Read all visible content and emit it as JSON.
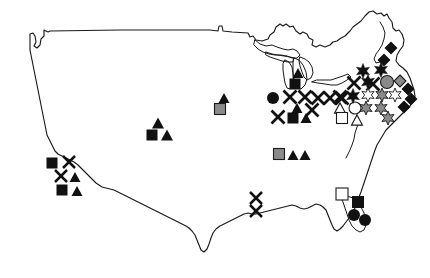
{
  "map": {
    "title": "United States distribution map",
    "region": "Contiguous United States",
    "background_color": "#ffffff",
    "outline_color": "#1a1a1a",
    "outline_width": 1.15,
    "width": 430,
    "height": 278
  },
  "palette": {
    "black": "#111111",
    "gray": "#8a8a8a",
    "white": "#ffffff",
    "stroke": "#1a1a1a"
  },
  "legend": {
    "shown": false,
    "shapes": [
      "star",
      "diamond",
      "circle",
      "square",
      "triangle",
      "x"
    ],
    "fills": [
      "black",
      "gray",
      "white"
    ]
  },
  "chart_data": {
    "type": "scatter",
    "xlabel": "",
    "ylabel": "",
    "xlim": [
      0,
      430
    ],
    "ylim": [
      0,
      278
    ],
    "grid": false,
    "legend_position": "none",
    "marker_counts": {
      "x": 24,
      "triangle": 16,
      "square": 11,
      "star": 13,
      "diamond": 9,
      "circle": 6,
      "total": 79
    },
    "fill_counts": {
      "black": 59,
      "gray": 14,
      "white": 6
    },
    "markers": [
      {
        "shape": "square",
        "fill": "black",
        "x": 52,
        "y": 163,
        "size": 11
      },
      {
        "shape": "x",
        "fill": "black",
        "x": 69,
        "y": 162,
        "size": 12
      },
      {
        "shape": "x",
        "fill": "black",
        "x": 61,
        "y": 176,
        "size": 12
      },
      {
        "shape": "triangle",
        "fill": "black",
        "x": 75,
        "y": 177,
        "size": 11
      },
      {
        "shape": "square",
        "fill": "black",
        "x": 62,
        "y": 190,
        "size": 11
      },
      {
        "shape": "triangle",
        "fill": "black",
        "x": 77,
        "y": 191,
        "size": 11
      },
      {
        "shape": "triangle",
        "fill": "black",
        "x": 158,
        "y": 123,
        "size": 12
      },
      {
        "shape": "square",
        "fill": "black",
        "x": 152,
        "y": 135,
        "size": 11
      },
      {
        "shape": "triangle",
        "fill": "black",
        "x": 167,
        "y": 135,
        "size": 12
      },
      {
        "shape": "triangle",
        "fill": "black",
        "x": 224,
        "y": 98,
        "size": 11
      },
      {
        "shape": "square",
        "fill": "gray",
        "x": 220,
        "y": 109,
        "size": 11
      },
      {
        "shape": "x",
        "fill": "black",
        "x": 256,
        "y": 198,
        "size": 12
      },
      {
        "shape": "x",
        "fill": "black",
        "x": 256,
        "y": 211,
        "size": 12
      },
      {
        "shape": "square",
        "fill": "gray",
        "x": 279,
        "y": 154,
        "size": 11
      },
      {
        "shape": "triangle",
        "fill": "black",
        "x": 293,
        "y": 155,
        "size": 11
      },
      {
        "shape": "triangle",
        "fill": "black",
        "x": 305,
        "y": 155,
        "size": 11
      },
      {
        "shape": "circle",
        "fill": "black",
        "x": 273,
        "y": 98,
        "size": 12
      },
      {
        "shape": "triangle",
        "fill": "black",
        "x": 298,
        "y": 73,
        "size": 11
      },
      {
        "shape": "square",
        "fill": "black",
        "x": 295,
        "y": 84,
        "size": 11
      },
      {
        "shape": "x",
        "fill": "black",
        "x": 290,
        "y": 97,
        "size": 13
      },
      {
        "shape": "x",
        "fill": "black",
        "x": 305,
        "y": 97,
        "size": 13
      },
      {
        "shape": "x",
        "fill": "black",
        "x": 318,
        "y": 98,
        "size": 13
      },
      {
        "shape": "x",
        "fill": "black",
        "x": 330,
        "y": 98,
        "size": 13
      },
      {
        "shape": "x",
        "fill": "black",
        "x": 342,
        "y": 98,
        "size": 13
      },
      {
        "shape": "triangle",
        "fill": "black",
        "x": 297,
        "y": 108,
        "size": 11
      },
      {
        "shape": "x",
        "fill": "black",
        "x": 312,
        "y": 110,
        "size": 13
      },
      {
        "shape": "x",
        "fill": "black",
        "x": 278,
        "y": 117,
        "size": 13
      },
      {
        "shape": "square",
        "fill": "black",
        "x": 293,
        "y": 118,
        "size": 11
      },
      {
        "shape": "triangle",
        "fill": "black",
        "x": 306,
        "y": 118,
        "size": 11
      },
      {
        "shape": "triangle",
        "fill": "white",
        "x": 340,
        "y": 108,
        "size": 11
      },
      {
        "shape": "circle",
        "fill": "white",
        "x": 355,
        "y": 108,
        "size": 12
      },
      {
        "shape": "square",
        "fill": "white",
        "x": 342,
        "y": 118,
        "size": 11
      },
      {
        "shape": "triangle",
        "fill": "white",
        "x": 357,
        "y": 120,
        "size": 11
      },
      {
        "shape": "star",
        "fill": "black",
        "x": 363,
        "y": 71,
        "size": 15
      },
      {
        "shape": "star",
        "fill": "black",
        "x": 381,
        "y": 70,
        "size": 15
      },
      {
        "shape": "diamond",
        "fill": "black",
        "x": 384,
        "y": 60,
        "size": 13
      },
      {
        "shape": "x",
        "fill": "black",
        "x": 354,
        "y": 83,
        "size": 13
      },
      {
        "shape": "star",
        "fill": "black",
        "x": 368,
        "y": 82,
        "size": 15
      },
      {
        "shape": "x",
        "fill": "black",
        "x": 373,
        "y": 84,
        "size": 13
      },
      {
        "shape": "circle",
        "fill": "gray",
        "x": 387,
        "y": 82,
        "size": 13
      },
      {
        "shape": "diamond",
        "fill": "gray",
        "x": 400,
        "y": 81,
        "size": 12
      },
      {
        "shape": "x",
        "fill": "black",
        "x": 340,
        "y": 97,
        "size": 13
      },
      {
        "shape": "star",
        "fill": "black",
        "x": 353,
        "y": 96,
        "size": 15
      },
      {
        "shape": "star",
        "fill": "white",
        "x": 368,
        "y": 95,
        "size": 14
      },
      {
        "shape": "star",
        "fill": "gray",
        "x": 382,
        "y": 95,
        "size": 14
      },
      {
        "shape": "star",
        "fill": "white",
        "x": 395,
        "y": 95,
        "size": 14
      },
      {
        "shape": "diamond",
        "fill": "black",
        "x": 408,
        "y": 89,
        "size": 13
      },
      {
        "shape": "diamond",
        "fill": "black",
        "x": 411,
        "y": 99,
        "size": 13
      },
      {
        "shape": "star",
        "fill": "gray",
        "x": 366,
        "y": 108,
        "size": 14
      },
      {
        "shape": "star",
        "fill": "gray",
        "x": 381,
        "y": 108,
        "size": 14
      },
      {
        "shape": "diamond",
        "fill": "black",
        "x": 404,
        "y": 107,
        "size": 13
      },
      {
        "shape": "star",
        "fill": "gray",
        "x": 388,
        "y": 118,
        "size": 14
      },
      {
        "shape": "diamond",
        "fill": "black",
        "x": 391,
        "y": 48,
        "size": 13
      },
      {
        "shape": "square",
        "fill": "white",
        "x": 342,
        "y": 194,
        "size": 12
      },
      {
        "shape": "square",
        "fill": "black",
        "x": 358,
        "y": 202,
        "size": 12
      },
      {
        "shape": "circle",
        "fill": "black",
        "x": 354,
        "y": 215,
        "size": 12
      },
      {
        "shape": "circle",
        "fill": "black",
        "x": 365,
        "y": 220,
        "size": 12
      }
    ]
  }
}
